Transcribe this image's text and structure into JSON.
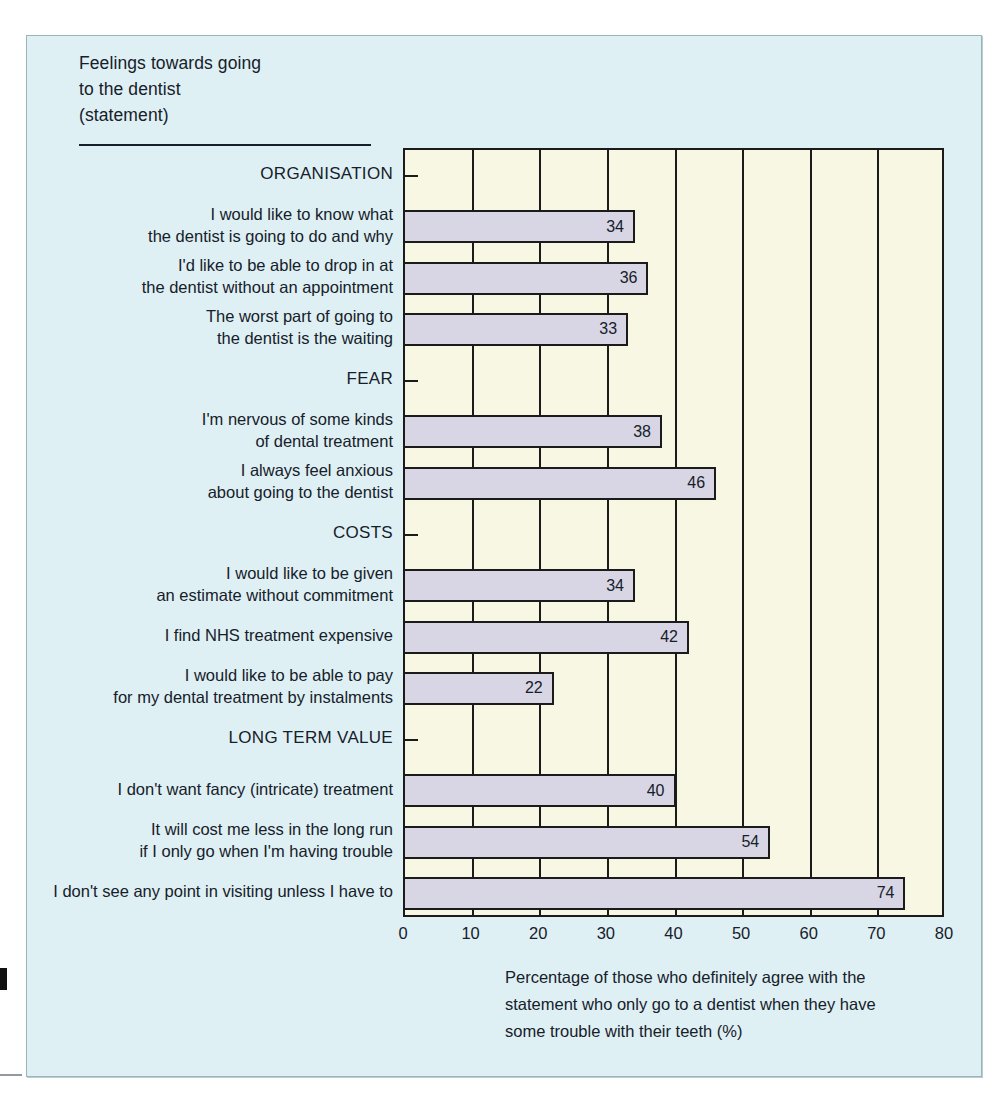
{
  "title": {
    "line1": "Feelings towards going",
    "line2": "to the dentist",
    "line3": "(statement)"
  },
  "caption": {
    "line1": "Percentage of those who definitely agree with the",
    "line2": "statement who only go to a dentist when they have",
    "line3": "some trouble with their teeth (%)"
  },
  "colors": {
    "panel_background": "#dff0f4",
    "plot_background": "#f8f7e3",
    "bar_fill": "#d8d6e4",
    "line": "#1b1b1b",
    "text": "#16202a"
  },
  "chart_data": {
    "type": "bar",
    "orientation": "horizontal",
    "title": "Feelings towards going to the dentist (statement)",
    "xlabel": "Percentage of those who definitely agree with the statement who only go to a dentist when they have some trouble with their teeth (%)",
    "ylabel": "",
    "xlim": [
      0,
      80
    ],
    "xticks": [
      0,
      10,
      20,
      30,
      40,
      50,
      60,
      70,
      80
    ],
    "xtick_labels": [
      "0",
      "10",
      "20",
      "30",
      "40",
      "50",
      "60",
      "70",
      "80"
    ],
    "grid": true,
    "legend": "none",
    "rows": [
      {
        "kind": "group",
        "label": "ORGANISATION"
      },
      {
        "kind": "bar",
        "label": "I would like to know what\nthe dentist is going to do and why",
        "value": 34
      },
      {
        "kind": "bar",
        "label": "I'd like to be able to drop in at\nthe dentist without an appointment",
        "value": 36
      },
      {
        "kind": "bar",
        "label": "The worst part of going to\nthe dentist is the waiting",
        "value": 33
      },
      {
        "kind": "group",
        "label": "FEAR"
      },
      {
        "kind": "bar",
        "label": "I'm nervous of some kinds\nof dental treatment",
        "value": 38
      },
      {
        "kind": "bar",
        "label": "I always feel anxious\nabout going to the dentist",
        "value": 46
      },
      {
        "kind": "group",
        "label": "COSTS"
      },
      {
        "kind": "bar",
        "label": "I would like to be given\nan estimate without commitment",
        "value": 34
      },
      {
        "kind": "bar",
        "label": "I find NHS treatment expensive",
        "value": 42
      },
      {
        "kind": "bar",
        "label": "I would like to be able to pay\nfor my dental treatment by instalments",
        "value": 22
      },
      {
        "kind": "group",
        "label": "LONG TERM VALUE"
      },
      {
        "kind": "bar",
        "label": "I don't want fancy (intricate) treatment",
        "value": 40
      },
      {
        "kind": "bar",
        "label": "It will cost me less in the long run\nif I only go when I'm having trouble",
        "value": 54
      },
      {
        "kind": "bar",
        "label": "I don't see any point in visiting unless I have to",
        "value": 74
      }
    ],
    "categories": [
      "I would like to know what the dentist is going to do and why",
      "I'd like to be able to drop in at the dentist without an appointment",
      "The worst part of going to the dentist is the waiting",
      "I'm nervous of some kinds of dental treatment",
      "I always feel anxious about going to the dentist",
      "I would like to be given an estimate without commitment",
      "I find NHS treatment expensive",
      "I would like to be able to pay for my dental treatment by instalments",
      "I don't want fancy (intricate) treatment",
      "It will cost me less in the long run if I only go when I'm having trouble",
      "I don't see any point in visiting unless I have to"
    ],
    "values": [
      34,
      36,
      33,
      38,
      46,
      34,
      42,
      22,
      40,
      54,
      74
    ],
    "groups": [
      "ORGANISATION",
      "FEAR",
      "COSTS",
      "LONG TERM VALUE"
    ]
  }
}
